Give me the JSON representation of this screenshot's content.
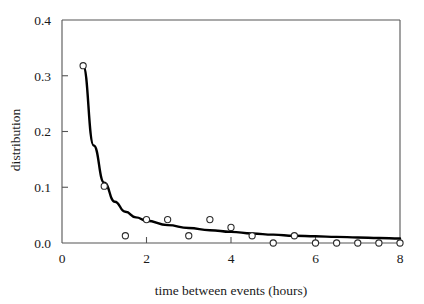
{
  "chart_data": {
    "type": "scatter",
    "title": "",
    "xlabel": "time between events (hours)",
    "ylabel": "distribution",
    "xlim": [
      0,
      8
    ],
    "ylim": [
      0.0,
      0.4
    ],
    "xticks": [
      0,
      2,
      4,
      6,
      8
    ],
    "xtick_labels": [
      "0",
      "2",
      "4",
      "6",
      "8"
    ],
    "yticks": [
      0.0,
      0.1,
      0.2,
      0.3,
      0.4
    ],
    "ytick_labels": [
      "0.0",
      "0.1",
      "0.2",
      "0.3",
      "0.4"
    ],
    "grid": false,
    "legend": "none",
    "marker_style": "open-circle",
    "series": [
      {
        "name": "observed distribution",
        "type": "scatter",
        "x": [
          0.5,
          1.0,
          1.5,
          2.0,
          2.5,
          3.0,
          3.5,
          4.0,
          4.5,
          5.0,
          5.5,
          6.0,
          6.5,
          7.0,
          7.5,
          8.0
        ],
        "values": [
          0.318,
          0.102,
          0.013,
          0.042,
          0.042,
          0.013,
          0.042,
          0.028,
          0.013,
          0.0,
          0.013,
          0.0,
          0.0,
          0.0,
          0.0,
          0.0
        ]
      },
      {
        "name": "fitted exponential curve",
        "type": "line",
        "x": [
          0.5,
          0.75,
          1.0,
          1.25,
          1.5,
          1.75,
          2.0,
          2.5,
          3.0,
          3.5,
          4.0,
          4.5,
          5.0,
          5.5,
          6.0,
          6.5,
          7.0,
          7.5,
          8.0
        ],
        "values": [
          0.318,
          0.175,
          0.108,
          0.074,
          0.056,
          0.046,
          0.04,
          0.032,
          0.027,
          0.023,
          0.02,
          0.017,
          0.015,
          0.013,
          0.012,
          0.011,
          0.01,
          0.009,
          0.008
        ]
      }
    ]
  },
  "colors": {
    "axis": "#555555",
    "curve": "#000000",
    "marker_stroke": "#2b2b2b",
    "marker_fill": "#ffffff",
    "background": "#ffffff",
    "text": "#1a1a1a"
  }
}
